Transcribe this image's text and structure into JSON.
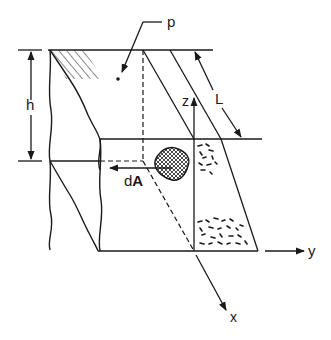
{
  "figure": {
    "labels": {
      "pressure": "p",
      "depth": "h",
      "length": "L",
      "z_axis": "z",
      "y_axis": "y",
      "x_axis": "x",
      "area_element": "dA",
      "area_element_bold": "A",
      "area_element_prefix": "d"
    },
    "colors": {
      "ink": "#1a1a1a",
      "background": "#ffffff"
    }
  }
}
